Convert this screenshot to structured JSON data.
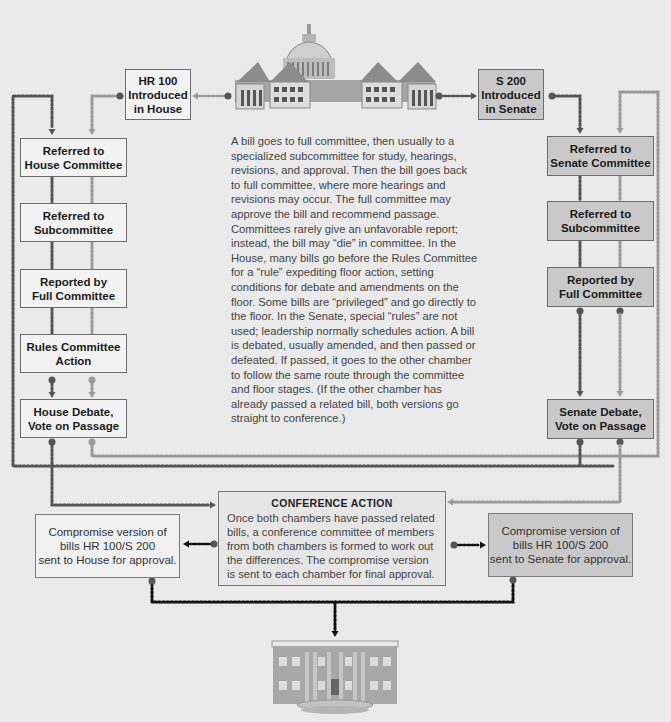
{
  "house": {
    "introduced": "HR 100\nIntroduced\nin House",
    "steps": [
      "Referred to\nHouse Committee",
      "Referred to\nSubcommittee",
      "Reported by\nFull Committee",
      "Rules Committee\nAction",
      "House Debate,\nVote on Passage"
    ],
    "compromise": "Compromise version of\nbills HR 100/S 200\nsent to House for approval."
  },
  "senate": {
    "introduced": "S 200\nIntroduced\nin Senate",
    "steps": [
      "Referred to\nSenate Committee",
      "Referred to\nSubcommittee",
      "Reported by\nFull Committee",
      "Senate Debate,\nVote on Passage"
    ],
    "compromise": "Compromise version of\nbills HR 100/S 200\nsent to Senate for approval."
  },
  "explanation": "A bill goes to full committee, then usually to a specialized subcommittee for study, hearings, revisions, and approval. Then the bill goes back to full committee, where more hearings and revisions may occur. The full committee may approve the bill and recommend passage. Committees rarely give an unfavorable report; instead, the bill may “die” in committee. In the House, many bills go before the Rules Committee for a “rule” expediting floor action, setting conditions for debate and amendments on the floor. Some bills are “privileged” and go directly to the floor. In the Senate, special “rules” are not used; leadership normally schedules action. A bill is debated, usually amended, and then passed or defeated. If passed, it goes to the other chamber to follow the same route through the committee and floor stages. (If the other chamber has already passed a related bill, both versions go straight to conference.)",
  "conference": {
    "title": "CONFERENCE ACTION",
    "body": "Once both chambers have passed related bills, a conference committee of members from both chambers is formed to work out the differences. The compromise version is sent to each chamber for final approval."
  },
  "icons": {
    "top": "capitol-building-icon",
    "bottom": "white-house-icon"
  },
  "colors": {
    "background": "#eaeaea",
    "house_box": "#f2f2f2",
    "senate_box": "#c9c9c9",
    "house_line": "#555555",
    "senate_line": "#9a9a9a",
    "final_line": "#111111"
  }
}
